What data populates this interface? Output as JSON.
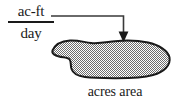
{
  "figure": {
    "background_color": "#ffffff",
    "ink_color": "#1a1a1a"
  },
  "rate_label": {
    "numerator": "ac-ft",
    "denominator": "day"
  },
  "connector": {
    "kind": "elbow-arrow",
    "direction": "right-then-down",
    "arrowhead": "solid-triangle-down"
  },
  "region": {
    "label": "acres area",
    "fill_pattern": "50-percent-checker-dither",
    "fill_color": "#8c8c8c",
    "outline_color": "#1a1a1a"
  }
}
